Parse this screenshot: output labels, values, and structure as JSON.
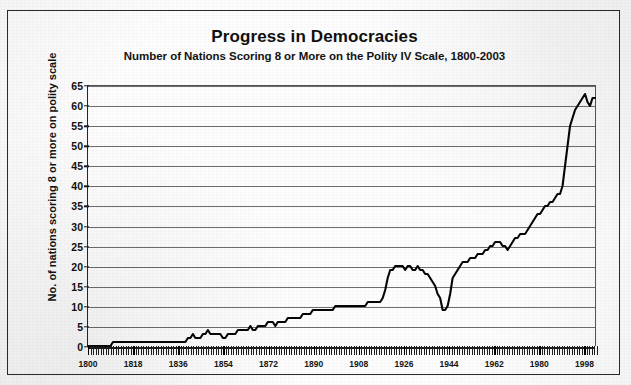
{
  "figure": {
    "border_color": "#2b2b2b",
    "background_color": "#fdfdfd"
  },
  "chart_data": {
    "type": "line",
    "title": "Progress in Democracies",
    "subtitle": "Number of Nations Scoring 8 or More on the Polity IV Scale, 1800-2003",
    "xlabel": "",
    "ylabel": "No. of nations scoring 8 or more on polity scale",
    "xlim": [
      1800,
      2003
    ],
    "ylim": [
      0,
      65
    ],
    "grid": true,
    "legend": "none",
    "line_color": "#050505",
    "y_ticks": [
      0,
      5,
      10,
      15,
      20,
      25,
      30,
      35,
      40,
      45,
      50,
      55,
      60,
      65
    ],
    "x_ticks": [
      1800,
      1818,
      1836,
      1854,
      1872,
      1890,
      1908,
      1926,
      1944,
      1962,
      1980,
      1998
    ],
    "x_minor_tick_interval": 1,
    "peak_value": 63,
    "final_value": 62,
    "x": [
      1800,
      1801,
      1802,
      1803,
      1804,
      1805,
      1806,
      1807,
      1808,
      1809,
      1810,
      1811,
      1812,
      1813,
      1814,
      1815,
      1816,
      1817,
      1818,
      1819,
      1820,
      1821,
      1822,
      1823,
      1824,
      1825,
      1826,
      1827,
      1828,
      1829,
      1830,
      1831,
      1832,
      1833,
      1834,
      1835,
      1836,
      1837,
      1838,
      1839,
      1840,
      1841,
      1842,
      1843,
      1844,
      1845,
      1846,
      1847,
      1848,
      1849,
      1850,
      1851,
      1852,
      1853,
      1854,
      1855,
      1856,
      1857,
      1858,
      1859,
      1860,
      1861,
      1862,
      1863,
      1864,
      1865,
      1866,
      1867,
      1868,
      1869,
      1870,
      1871,
      1872,
      1873,
      1874,
      1875,
      1876,
      1877,
      1878,
      1879,
      1880,
      1881,
      1882,
      1883,
      1884,
      1885,
      1886,
      1887,
      1888,
      1889,
      1890,
      1891,
      1892,
      1893,
      1894,
      1895,
      1896,
      1897,
      1898,
      1899,
      1900,
      1901,
      1902,
      1903,
      1904,
      1905,
      1906,
      1907,
      1908,
      1909,
      1910,
      1911,
      1912,
      1913,
      1914,
      1915,
      1916,
      1917,
      1918,
      1919,
      1920,
      1921,
      1922,
      1923,
      1924,
      1925,
      1926,
      1927,
      1928,
      1929,
      1930,
      1931,
      1932,
      1933,
      1934,
      1935,
      1936,
      1937,
      1938,
      1939,
      1940,
      1941,
      1942,
      1943,
      1944,
      1945,
      1946,
      1947,
      1948,
      1949,
      1950,
      1951,
      1952,
      1953,
      1954,
      1955,
      1956,
      1957,
      1958,
      1959,
      1960,
      1961,
      1962,
      1963,
      1964,
      1965,
      1966,
      1967,
      1968,
      1969,
      1970,
      1971,
      1972,
      1973,
      1974,
      1975,
      1976,
      1977,
      1978,
      1979,
      1980,
      1981,
      1982,
      1983,
      1984,
      1985,
      1986,
      1987,
      1988,
      1989,
      1990,
      1991,
      1992,
      1993,
      1994,
      1995,
      1996,
      1997,
      1998,
      1999,
      2000,
      2001,
      2002,
      2003
    ],
    "y": [
      0,
      0,
      0,
      0,
      0,
      0,
      0,
      0,
      0,
      0,
      1,
      1,
      1,
      1,
      1,
      1,
      1,
      1,
      1,
      1,
      1,
      1,
      1,
      1,
      1,
      1,
      1,
      1,
      1,
      1,
      1,
      1,
      1,
      1,
      1,
      1,
      1,
      1,
      1,
      1,
      2,
      2,
      3,
      2,
      2,
      2,
      3,
      3,
      4,
      3,
      3,
      3,
      3,
      3,
      2,
      2,
      3,
      3,
      3,
      3,
      4,
      4,
      4,
      4,
      4,
      5,
      4,
      4,
      5,
      5,
      5,
      5,
      6,
      6,
      6,
      5,
      6,
      6,
      6,
      6,
      7,
      7,
      7,
      7,
      7,
      7,
      8,
      8,
      8,
      8,
      9,
      9,
      9,
      9,
      9,
      9,
      9,
      9,
      9,
      10,
      10,
      10,
      10,
      10,
      10,
      10,
      10,
      10,
      10,
      10,
      10,
      10,
      11,
      11,
      11,
      11,
      11,
      11,
      12,
      14,
      17,
      19,
      19,
      20,
      20,
      20,
      20,
      19,
      20,
      20,
      19,
      19,
      20,
      19,
      19,
      18,
      18,
      17,
      16,
      15,
      13,
      12,
      9,
      9,
      10,
      13,
      17,
      18,
      19,
      20,
      21,
      21,
      21,
      22,
      22,
      22,
      23,
      23,
      23,
      24,
      24,
      25,
      25,
      26,
      26,
      26,
      25,
      25,
      24,
      25,
      26,
      27,
      27,
      28,
      28,
      28,
      29,
      30,
      31,
      32,
      33,
      33,
      34,
      35,
      35,
      36,
      36,
      37,
      38,
      38,
      40,
      45,
      50,
      55,
      57,
      59,
      60,
      61,
      62,
      63,
      61,
      60,
      62,
      62,
      62,
      62
    ]
  }
}
